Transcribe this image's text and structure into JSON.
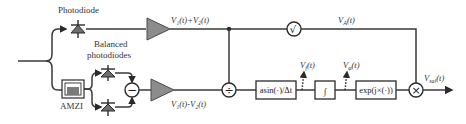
{
  "diagram": {
    "labels": {
      "photodiode": "Photodiode",
      "balanced_line1": "Balanced",
      "balanced_line2": "photodiodes",
      "amzi": "AMZI"
    },
    "signals": {
      "sum": "V₁(t)+V₂(t)",
      "diff": "V₁(t)-V₂(t)",
      "amplitude": "Vₐ(t)",
      "freq": "V_f(t)",
      "phase": "V_φ(t)",
      "output": "V_sal(t)"
    },
    "signals_parts": {
      "amplitude_main": "V",
      "amplitude_sub": "A",
      "amplitude_tail": "(t)",
      "freq_main": "V",
      "freq_sub": "f",
      "freq_tail": "(t)",
      "phase_main": "V",
      "phase_sub": "φ",
      "phase_tail": "(t)",
      "output_main": "V",
      "output_sub": "sal",
      "output_tail": "(t)",
      "sum_text": "V₁(t)+V₂(t)",
      "diff_text": "V₁(t)-V₂(t)"
    },
    "blocks": {
      "asin": "asin(·)/Δt",
      "integrator": "∫",
      "exp": "exp(j×(·))",
      "sqrt": "√",
      "divide": "÷",
      "subtract": "−",
      "multiply": "×"
    }
  }
}
